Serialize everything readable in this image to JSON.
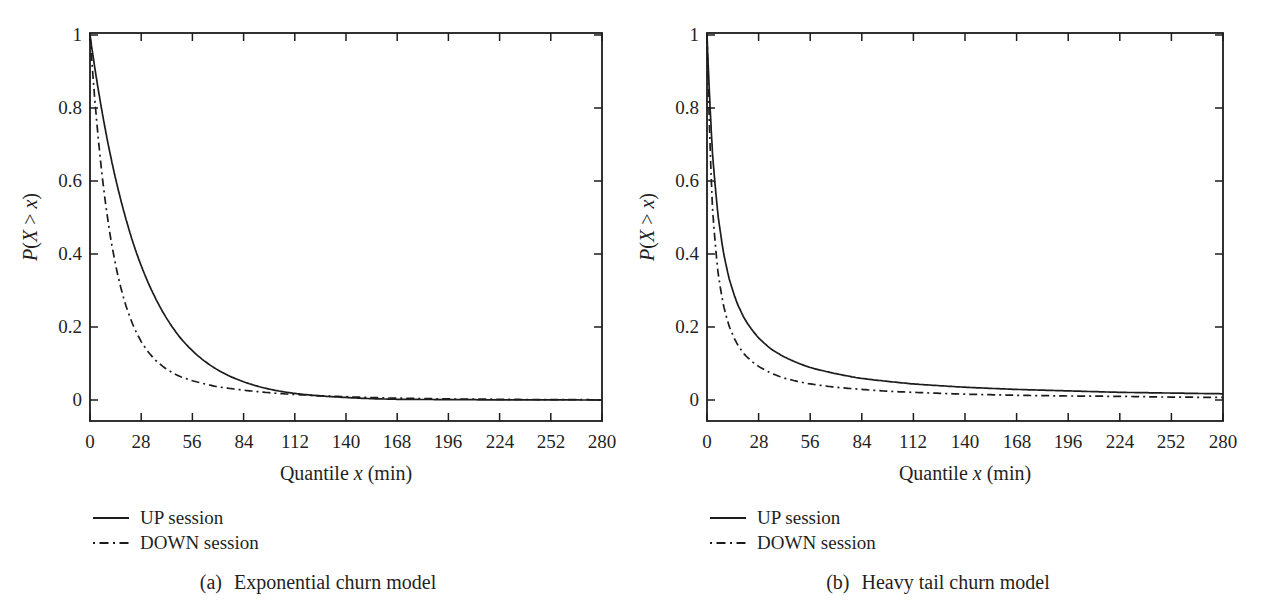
{
  "figure": {
    "background": "#ffffff",
    "line_color": "#1c1c1c",
    "text_color": "#1f1f1f"
  },
  "chart_data": [
    {
      "id": "a",
      "type": "line",
      "caption_label": "(a)",
      "caption_text": "Exponential churn model",
      "xlabel": "Quantile x (min)",
      "ylabel": "P(X > x)",
      "xlabel_parts": [
        {
          "text": "Quantile ",
          "italic": false
        },
        {
          "text": "x",
          "italic": true
        },
        {
          "text": " (min)",
          "italic": false
        }
      ],
      "ylabel_parts": [
        {
          "text": "P",
          "italic": true
        },
        {
          "text": "(",
          "italic": false
        },
        {
          "text": "X",
          "italic": true
        },
        {
          "text": " > ",
          "italic": false
        },
        {
          "text": "x",
          "italic": true
        },
        {
          "text": ")",
          "italic": false
        }
      ],
      "xlim": [
        0,
        280
      ],
      "ylim": [
        0,
        1
      ],
      "grid": false,
      "legend_position": "below-left",
      "xticks": [
        0,
        28,
        56,
        84,
        112,
        140,
        168,
        196,
        224,
        252,
        280
      ],
      "yticks": [
        0,
        0.2,
        0.4,
        0.6,
        0.8,
        1
      ],
      "ytick_labels": [
        "0",
        "0.2",
        "0.4",
        "0.6",
        "0.8",
        "1"
      ],
      "x": [
        0,
        3,
        6,
        9,
        12,
        16,
        20,
        24,
        28,
        35,
        42,
        49,
        56,
        70,
        84,
        98,
        112,
        140,
        168,
        196,
        224,
        252,
        280
      ],
      "series": [
        {
          "name": "UP session",
          "style": "solid",
          "y": [
            1,
            0.898,
            0.807,
            0.725,
            0.651,
            0.565,
            0.49,
            0.424,
            0.368,
            0.287,
            0.223,
            0.173,
            0.135,
            0.082,
            0.05,
            0.03,
            0.018,
            0.007,
            0.002,
            0.001,
            0.0005,
            0.0002,
            0.0001
          ]
        },
        {
          "name": "DOWN session",
          "style": "dashdot",
          "y": [
            1,
            0.801,
            0.644,
            0.52,
            0.423,
            0.325,
            0.253,
            0.2,
            0.16,
            0.113,
            0.084,
            0.065,
            0.053,
            0.036,
            0.027,
            0.02,
            0.015,
            0.009,
            0.005,
            0.003,
            0.002,
            0.001,
            0.0006
          ]
        }
      ]
    },
    {
      "id": "b",
      "type": "line",
      "caption_label": "(b)",
      "caption_text": "Heavy tail churn model",
      "xlabel": "Quantile x (min)",
      "ylabel": "P(X > x)",
      "xlabel_parts": [
        {
          "text": "Quantile ",
          "italic": false
        },
        {
          "text": "x",
          "italic": true
        },
        {
          "text": " (min)",
          "italic": false
        }
      ],
      "ylabel_parts": [
        {
          "text": "P",
          "italic": true
        },
        {
          "text": "(",
          "italic": false
        },
        {
          "text": "X",
          "italic": true
        },
        {
          "text": " > ",
          "italic": false
        },
        {
          "text": "x",
          "italic": true
        },
        {
          "text": ")",
          "italic": false
        }
      ],
      "xlim": [
        0,
        280
      ],
      "ylim": [
        0,
        1
      ],
      "grid": false,
      "legend_position": "below-left",
      "xticks": [
        0,
        28,
        56,
        84,
        112,
        140,
        168,
        196,
        224,
        252,
        280
      ],
      "yticks": [
        0,
        0.2,
        0.4,
        0.6,
        0.8,
        1
      ],
      "ytick_labels": [
        "0",
        "0.2",
        "0.4",
        "0.6",
        "0.8",
        "1"
      ],
      "x": [
        0,
        3,
        6,
        9,
        12,
        16,
        20,
        24,
        28,
        35,
        42,
        49,
        56,
        70,
        84,
        98,
        112,
        140,
        168,
        196,
        224,
        252,
        280
      ],
      "series": [
        {
          "name": "UP session",
          "style": "solid",
          "y": [
            1,
            0.675,
            0.506,
            0.403,
            0.333,
            0.27,
            0.226,
            0.195,
            0.17,
            0.139,
            0.118,
            0.102,
            0.089,
            0.072,
            0.059,
            0.051,
            0.044,
            0.035,
            0.029,
            0.025,
            0.021,
            0.019,
            0.017
          ]
        },
        {
          "name": "DOWN session",
          "style": "dashdot",
          "y": [
            1,
            0.525,
            0.349,
            0.258,
            0.203,
            0.157,
            0.127,
            0.107,
            0.092,
            0.073,
            0.06,
            0.051,
            0.044,
            0.035,
            0.029,
            0.024,
            0.021,
            0.016,
            0.013,
            0.011,
            0.01,
            0.008,
            0.007
          ]
        }
      ]
    }
  ]
}
